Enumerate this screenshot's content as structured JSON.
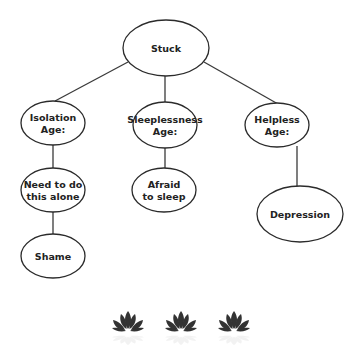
{
  "diagram": {
    "type": "tree",
    "colors": {
      "stroke": "#2b2b2b",
      "text": "#222222",
      "background": "#ffffff",
      "lotus": "#333333"
    },
    "nodes": [
      {
        "id": "stuck",
        "lines": [
          "Stuck"
        ],
        "cx": 166,
        "cy": 48,
        "rx": 43,
        "ry": 28
      },
      {
        "id": "isolation",
        "lines": [
          "Isolation",
          "Age:"
        ],
        "cx": 53,
        "cy": 123,
        "rx": 32,
        "ry": 22
      },
      {
        "id": "sleeplessness",
        "lines": [
          "Sleeplessness",
          "Age:"
        ],
        "cx": 165,
        "cy": 125,
        "rx": 32,
        "ry": 23
      },
      {
        "id": "helpless",
        "lines": [
          "Helpless",
          "Age:"
        ],
        "cx": 277,
        "cy": 125,
        "rx": 32,
        "ry": 22
      },
      {
        "id": "need-alone",
        "lines": [
          "Need to do",
          "this alone"
        ],
        "cx": 53,
        "cy": 190,
        "rx": 32,
        "ry": 22
      },
      {
        "id": "afraid-sleep",
        "lines": [
          "Afraid",
          "to sleep"
        ],
        "cx": 164,
        "cy": 190,
        "rx": 32,
        "ry": 22
      },
      {
        "id": "depression",
        "lines": [
          "Depression"
        ],
        "cx": 300,
        "cy": 214,
        "rx": 43,
        "ry": 28
      },
      {
        "id": "shame",
        "lines": [
          "Shame"
        ],
        "cx": 53,
        "cy": 256,
        "rx": 32,
        "ry": 22
      }
    ],
    "edges": [
      {
        "from": "stuck",
        "to": "isolation",
        "x1": 128,
        "y1": 62,
        "x2": 55,
        "y2": 101
      },
      {
        "from": "stuck",
        "to": "sleeplessness",
        "x1": 165,
        "y1": 76,
        "x2": 165,
        "y2": 102
      },
      {
        "from": "stuck",
        "to": "helpless",
        "x1": 204,
        "y1": 62,
        "x2": 278,
        "y2": 104
      },
      {
        "from": "isolation",
        "to": "need-alone",
        "x1": 53,
        "y1": 145,
        "x2": 53,
        "y2": 168
      },
      {
        "from": "sleeplessness",
        "to": "afraid-sleep",
        "x1": 165,
        "y1": 148,
        "x2": 165,
        "y2": 169
      },
      {
        "from": "helpless",
        "to": "depression",
        "x1": 297,
        "y1": 146,
        "x2": 297,
        "y2": 186
      },
      {
        "from": "need-alone",
        "to": "shame",
        "x1": 53,
        "y1": 212,
        "x2": 53,
        "y2": 235
      }
    ]
  },
  "decorations": {
    "lotus_icons": [
      {
        "name": "lotus-icon",
        "cx": 128,
        "cy": 322
      },
      {
        "name": "lotus-icon",
        "cx": 181,
        "cy": 322
      },
      {
        "name": "lotus-icon",
        "cx": 234,
        "cy": 322
      }
    ]
  }
}
